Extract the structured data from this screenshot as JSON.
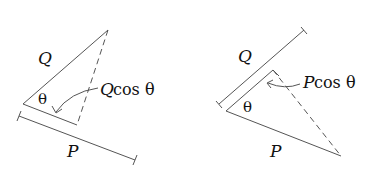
{
  "figures": [
    {
      "id": "left",
      "description": "Projection of Q onto P",
      "labels": {
        "vector_a": "Q",
        "vector_b": "P",
        "angle": "θ",
        "projection_var": "Q",
        "projection_rest": " cos θ"
      }
    },
    {
      "id": "right",
      "description": "Projection of P onto Q",
      "labels": {
        "vector_a": "Q",
        "vector_b": "P",
        "angle": "θ",
        "projection_var": "P",
        "projection_rest": " cos θ"
      }
    }
  ],
  "colors": {
    "line": "#555555",
    "text": "#111111",
    "background": "#ffffff"
  }
}
